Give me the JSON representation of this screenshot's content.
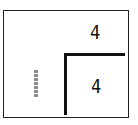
{
  "diagram": {
    "type": "region-puzzle-grid",
    "frame": {
      "border_color": "#222222",
      "background": "#ffffff"
    },
    "dividers": [
      {
        "orientation": "horizontal",
        "color": "#111111"
      },
      {
        "orientation": "vertical",
        "color": "#111111"
      }
    ],
    "labels": [
      {
        "id": "top-right",
        "value": "4"
      },
      {
        "id": "bottom-right",
        "value": "4"
      }
    ],
    "marks": [
      {
        "id": "left-dashed",
        "style": "dashed-vertical",
        "color": "#8a8a8a"
      }
    ]
  }
}
